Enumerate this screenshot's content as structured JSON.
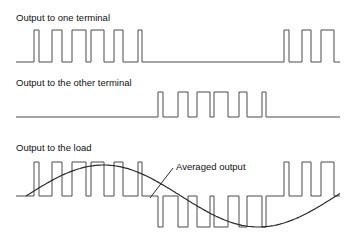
{
  "panels": [
    {
      "title": "Output to one terminal",
      "baseline_y": 62,
      "high_y": 30,
      "x_start": 16,
      "x_end": 340,
      "pulses": [
        [
          34,
          39
        ],
        [
          52,
          62
        ],
        [
          72,
          86
        ],
        [
          91,
          104
        ],
        [
          114,
          123
        ],
        [
          138,
          142
        ],
        [
          284,
          289
        ],
        [
          302,
          311
        ],
        [
          321,
          334
        ]
      ]
    },
    {
      "title": "Output to the other terminal",
      "baseline_y": 117,
      "high_y": 92,
      "x_start": 16,
      "x_end": 340,
      "pulses": [
        [
          158,
          163
        ],
        [
          178,
          188
        ],
        [
          197,
          210
        ],
        [
          214,
          228
        ],
        [
          239,
          247
        ],
        [
          262,
          266
        ]
      ]
    },
    {
      "title": "Output to the load",
      "baseline_y": 196,
      "high_y": 162,
      "low_y": 227,
      "x_start": 16,
      "x_end": 340,
      "pos_pulses": [
        [
          34,
          39
        ],
        [
          52,
          62
        ],
        [
          72,
          86
        ],
        [
          91,
          104
        ],
        [
          114,
          123
        ],
        [
          138,
          142
        ],
        [
          284,
          289
        ],
        [
          302,
          311
        ],
        [
          321,
          334
        ]
      ],
      "neg_pulses": [
        [
          158,
          163
        ],
        [
          178,
          188
        ],
        [
          197,
          210
        ],
        [
          214,
          228
        ],
        [
          239,
          247
        ],
        [
          262,
          266
        ]
      ]
    }
  ],
  "annotation": {
    "label": "Averaged output"
  },
  "averaged_curve": {
    "x_start": 26,
    "x_end": 340,
    "center_y": 196,
    "amplitude": 31,
    "period_px": 310
  }
}
